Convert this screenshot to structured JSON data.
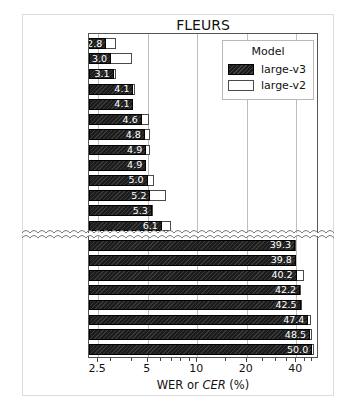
{
  "chart_data": {
    "type": "bar",
    "title": "FLEURS",
    "xlabel_plain": "WER or ",
    "xlabel_italic": "CER",
    "xlabel_suffix": " (%)",
    "xlabel": "WER or CER (%)",
    "ylabel": "",
    "orientation": "horizontal",
    "xscale": "log",
    "xlim": [
      2.2,
      55.0
    ],
    "xticks": [
      2.5,
      5,
      10,
      20,
      40
    ],
    "xticklabels": [
      "2.5",
      "5",
      "10",
      "20",
      "40"
    ],
    "grid": "vertical-only",
    "broken_axis": true,
    "broken_axis_note": "wavy break between Indonesian and Telugu",
    "legend": {
      "title": "Model",
      "position": "upper right",
      "entries": [
        {
          "name": "large-v3",
          "style": "filled-black-hatched"
        },
        {
          "name": "large-v2",
          "style": "open-white"
        }
      ]
    },
    "series": [
      {
        "name": "large-v3",
        "color": "#1c1c1c"
      },
      {
        "name": "large-v2",
        "color": "#ffffff"
      }
    ],
    "italic_label_meaning": "CER metric",
    "groups": [
      {
        "id": "top",
        "categories": [
          {
            "label": "Spanish",
            "metric": "WER",
            "italic": false,
            "large_v3": 2.8,
            "large_v2": 3.2
          },
          {
            "label": "Italian",
            "metric": "WER",
            "italic": false,
            "large_v3": 3.0,
            "large_v2": 4.0
          },
          {
            "label": "Korean",
            "metric": "CER",
            "italic": true,
            "large_v3": 3.1,
            "large_v2": 3.2
          },
          {
            "label": "Portuguese",
            "metric": "WER",
            "italic": false,
            "large_v3": 4.1,
            "large_v2": 4.2
          },
          {
            "label": "English",
            "metric": "WER",
            "italic": false,
            "large_v3": 4.1,
            "large_v2": 4.1
          },
          {
            "label": "Polish",
            "metric": "WER",
            "italic": false,
            "large_v3": 4.6,
            "large_v2": 5.1
          },
          {
            "label": "Catalan",
            "metric": "WER",
            "italic": false,
            "large_v3": 4.8,
            "large_v2": 5.2
          },
          {
            "label": "Japanese",
            "metric": "CER",
            "italic": true,
            "large_v3": 4.9,
            "large_v2": 5.2
          },
          {
            "label": "German",
            "metric": "WER",
            "italic": false,
            "large_v3": 4.9,
            "large_v2": 4.9
          },
          {
            "label": "Russian",
            "metric": "WER",
            "italic": false,
            "large_v3": 5.0,
            "large_v2": 5.5
          },
          {
            "label": "Dutch",
            "metric": "WER",
            "italic": false,
            "large_v3": 5.2,
            "large_v2": 6.5
          },
          {
            "label": "French",
            "metric": "WER",
            "italic": false,
            "large_v3": 5.3,
            "large_v2": 5.4
          },
          {
            "label": "Indonesian",
            "metric": "WER",
            "italic": false,
            "large_v3": 6.1,
            "large_v2": 6.9
          }
        ]
      },
      {
        "id": "bottom",
        "categories": [
          {
            "label": "Telugu",
            "metric": "WER",
            "italic": false,
            "large_v3": 39.3,
            "large_v2": 39.6
          },
          {
            "label": "Maori",
            "metric": "WER",
            "italic": false,
            "large_v3": 39.8,
            "large_v2": 40.0
          },
          {
            "label": "Nepali",
            "metric": "WER",
            "italic": false,
            "large_v3": 40.2,
            "large_v2": 44.8
          },
          {
            "label": "Armenian",
            "metric": "WER",
            "italic": false,
            "large_v3": 42.2,
            "large_v2": 43.0
          },
          {
            "label": "Belarusian",
            "metric": "WER",
            "italic": false,
            "large_v3": 42.5,
            "large_v2": 43.3
          },
          {
            "label": "Gujarati",
            "metric": "WER",
            "italic": false,
            "large_v3": 47.4,
            "large_v2": 49.5
          },
          {
            "label": "Punjabi",
            "metric": "WER",
            "italic": false,
            "large_v3": 48.5,
            "large_v2": 49.6
          },
          {
            "label": "Bengali",
            "metric": "WER",
            "italic": false,
            "large_v3": 50.0,
            "large_v2": 51.5
          }
        ]
      }
    ]
  }
}
